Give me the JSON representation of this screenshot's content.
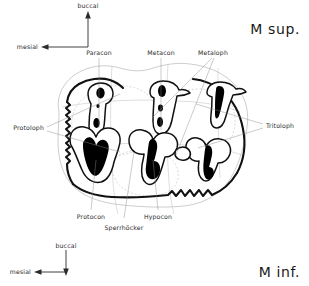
{
  "figure": {
    "title_upper": "M sup.",
    "title_lower": "M inf.",
    "orientation_top": {
      "vertical_label": "buccal",
      "horizontal_label": "mesial",
      "vertical_direction": "up",
      "horizontal_direction": "left"
    },
    "orientation_bottom": {
      "vertical_label": "buccal",
      "horizontal_label": "mesial",
      "vertical_direction": "down",
      "horizontal_direction": "left"
    },
    "labels_top": [
      {
        "text": "Paracon"
      },
      {
        "text": "Metacon"
      },
      {
        "text": "Metaloph"
      }
    ],
    "labels_left": [
      {
        "text": "Protoloph"
      }
    ],
    "labels_right": [
      {
        "text": "Tritoloph"
      }
    ],
    "labels_bottom": [
      {
        "text": "Protocon"
      },
      {
        "text": "Sperrhöcker"
      },
      {
        "text": "Hypocon"
      }
    ],
    "colors": {
      "ink": "#111111",
      "dentine": "#000000",
      "leader": "#8a8a8a",
      "faint_outline": "#9a9a9a",
      "background": "#ffffff"
    }
  }
}
